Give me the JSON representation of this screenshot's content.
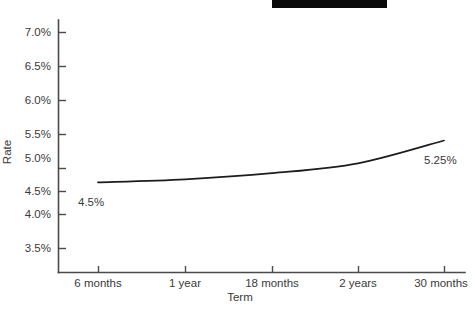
{
  "chart_data": {
    "type": "line",
    "title": "",
    "xlabel": "Term",
    "ylabel": "Rate",
    "grid": false,
    "legend": "none",
    "x_categories": [
      "6 months",
      "1 year",
      "18 months",
      "2 years",
      "30 months"
    ],
    "y_tick_labels": [
      "7.0%",
      "6.5%",
      "6.0%",
      "5.5%",
      "5.0%",
      "4.5%",
      "4.0%",
      "3.5%"
    ],
    "y_tick_values": [
      7.0,
      6.5,
      6.0,
      5.5,
      5.0,
      4.5,
      4.0,
      3.5
    ],
    "ylim": [
      3.25,
      7.25
    ],
    "series": [
      {
        "name": "Rate",
        "values": [
          4.57,
          4.62,
          4.72,
          4.88,
          5.25
        ]
      }
    ],
    "annotations": [
      {
        "text": "4.5%",
        "x_category": "6 months",
        "value": 4.5
      },
      {
        "text": "5.25%",
        "x_category": "30 months",
        "value": 5.25
      }
    ]
  },
  "ticks": {
    "y": {
      "t0": "7.0%",
      "t1": "6.5%",
      "t2": "6.0%",
      "t3": "5.5%",
      "t4": "5.0%",
      "t5": "4.5%",
      "t6": "4.0%",
      "t7": "3.5%"
    },
    "x": {
      "t0": "6 months",
      "t1": "1 year",
      "t2": "18 months",
      "t3": "2 years",
      "t4": "30 months"
    }
  },
  "axes": {
    "y_title": "Rate",
    "x_title": "Term"
  },
  "labels": {
    "start_value": "4.5%",
    "end_value": "5.25%"
  }
}
